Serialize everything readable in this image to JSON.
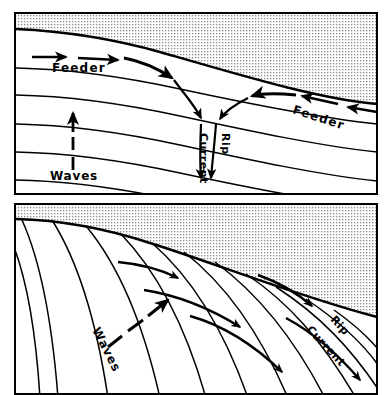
{
  "figure": {
    "background_color": "#ffffff",
    "line_color": "#000000",
    "land_fill_color": "#d9d9d9",
    "width": 391,
    "height": 395
  },
  "panels": [
    {
      "id": "panel-top",
      "name": "perpendicular-wave-approach",
      "bounds": {
        "x": 14,
        "y": 12,
        "width": 364,
        "height": 183
      },
      "land": {
        "name": "beach-land-mass",
        "fill": "stipple",
        "shoreline_description": "gently curving shoreline sloping down to the right"
      },
      "labels": [
        {
          "id": "feeder-left",
          "text": "Feeder",
          "x": 52,
          "y": 72,
          "rotation": 0,
          "size": 12
        },
        {
          "id": "feeder-right",
          "text": "Feeder",
          "x": 292,
          "y": 113,
          "rotation": 18,
          "size": 12
        },
        {
          "id": "current-top",
          "text": "Current",
          "x": 200,
          "y": 133,
          "rotation": 90,
          "size": 11
        },
        {
          "id": "rip-top",
          "text": "Rip",
          "x": 222,
          "y": 133,
          "rotation": 90,
          "size": 11
        },
        {
          "id": "waves-top",
          "text": "Waves",
          "x": 50,
          "y": 180,
          "rotation": 0,
          "size": 12
        }
      ],
      "wave_crests": 5,
      "arrows": {
        "feeder_left_straight": 2,
        "feeder_right_straight": 2,
        "feeder_left_curved": 1,
        "feeder_right_curved": 1,
        "rip_neck_straight": 2,
        "waves_dashed": 1
      }
    },
    {
      "id": "panel-bottom",
      "name": "oblique-wave-approach",
      "bounds": {
        "x": 14,
        "y": 203,
        "width": 364,
        "height": 192
      },
      "land": {
        "name": "beach-land-mass",
        "fill": "stipple",
        "shoreline_description": "shoreline sloping steeply down to the right"
      },
      "labels": [
        {
          "id": "waves-bottom",
          "text": "Waves",
          "x": 92,
          "y": 330,
          "rotation": 63,
          "size": 12
        },
        {
          "id": "rip-bottom",
          "text": "Rip",
          "x": 330,
          "y": 320,
          "rotation": 47,
          "size": 11
        },
        {
          "id": "current-bottom",
          "text": "Current",
          "x": 306,
          "y": 330,
          "rotation": 47,
          "size": 11
        }
      ],
      "wave_crests": 12,
      "arrows": {
        "longshore_flow": 5,
        "waves_dashed": 1
      }
    }
  ]
}
